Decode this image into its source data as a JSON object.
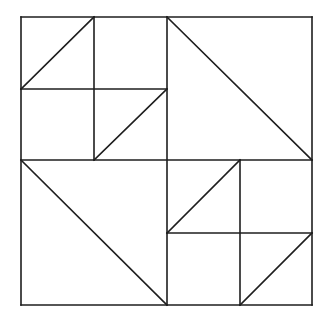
{
  "canvas": {
    "width": 328,
    "height": 322,
    "background": "#ffffff"
  },
  "stroke_color": "#1e1e1e",
  "stroke_width": 1.6,
  "outer_square": {
    "x1": 21,
    "y1": 17,
    "x2": 312,
    "y2": 305
  },
  "grid": {
    "mid_x": 167,
    "mid_y": 160,
    "quadrant_top_left_split": {
      "x": 94,
      "y": 89
    },
    "quadrant_bottom_right_split": {
      "x": 240,
      "y": 233
    }
  },
  "segments": [
    {
      "name": "outer-top-edge",
      "x1": 21,
      "y1": 17,
      "x2": 312,
      "y2": 17
    },
    {
      "name": "outer-bottom-edge",
      "x1": 21,
      "y1": 305,
      "x2": 312,
      "y2": 305
    },
    {
      "name": "outer-left-edge",
      "x1": 21,
      "y1": 17,
      "x2": 21,
      "y2": 305
    },
    {
      "name": "outer-right-edge",
      "x1": 312,
      "y1": 17,
      "x2": 312,
      "y2": 305
    },
    {
      "name": "center-vertical-line",
      "x1": 167,
      "y1": 17,
      "x2": 167,
      "y2": 305
    },
    {
      "name": "center-horizontal-line",
      "x1": 21,
      "y1": 160,
      "x2": 312,
      "y2": 160
    },
    {
      "name": "top-left-quadrant-vertical",
      "x1": 94,
      "y1": 17,
      "x2": 94,
      "y2": 160
    },
    {
      "name": "top-left-quadrant-horizontal",
      "x1": 21,
      "y1": 89,
      "x2": 167,
      "y2": 89
    },
    {
      "name": "top-left-sub-square-diagonal",
      "x1": 21,
      "y1": 89,
      "x2": 94,
      "y2": 17
    },
    {
      "name": "top-left-bottom-right-sub-square-diagonal",
      "x1": 94,
      "y1": 160,
      "x2": 167,
      "y2": 89
    },
    {
      "name": "top-right-quadrant-diagonal",
      "x1": 167,
      "y1": 17,
      "x2": 312,
      "y2": 160
    },
    {
      "name": "bottom-left-quadrant-diagonal",
      "x1": 21,
      "y1": 160,
      "x2": 167,
      "y2": 305
    },
    {
      "name": "bottom-right-quadrant-vertical",
      "x1": 240,
      "y1": 160,
      "x2": 240,
      "y2": 305
    },
    {
      "name": "bottom-right-quadrant-horizontal",
      "x1": 167,
      "y1": 233,
      "x2": 312,
      "y2": 233
    },
    {
      "name": "bottom-right-top-left-sub-square-diagonal",
      "x1": 167,
      "y1": 233,
      "x2": 240,
      "y2": 160
    },
    {
      "name": "bottom-right-bottom-right-sub-square-diagonal",
      "x1": 240,
      "y1": 305,
      "x2": 312,
      "y2": 233
    }
  ]
}
